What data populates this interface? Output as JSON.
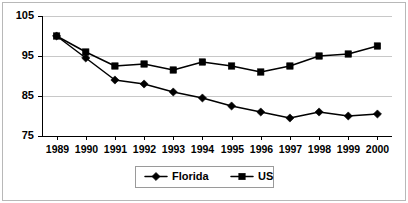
{
  "chart_data": {
    "type": "line",
    "title": "",
    "xlabel": "",
    "ylabel": "",
    "categories": [
      "1989",
      "1990",
      "1991",
      "1992",
      "1993",
      "1994",
      "1995",
      "1996",
      "1997",
      "1998",
      "1999",
      "2000"
    ],
    "series": [
      {
        "name": "Florida",
        "marker": "diamond",
        "color": "#000000",
        "values": [
          100,
          94.5,
          89,
          88,
          86,
          84.5,
          82.5,
          81,
          79.5,
          81,
          80,
          80.5
        ]
      },
      {
        "name": "US",
        "marker": "square",
        "color": "#000000",
        "values": [
          100,
          96,
          92.5,
          93,
          91.5,
          93.5,
          92.5,
          91,
          92.5,
          95,
          95.5,
          97.5
        ]
      }
    ],
    "ylim": [
      75,
      105
    ],
    "y_ticks": [
      75,
      85,
      95,
      105
    ],
    "y_tick_labels": [
      "75",
      "85",
      "95",
      "105"
    ],
    "grid": true,
    "grid_axis": "y",
    "legend_position": "bottom",
    "legend_entries": [
      "Florida",
      "US"
    ]
  },
  "axes": {
    "y_labels": [
      "105",
      "95",
      "85",
      "75"
    ],
    "x_labels": [
      "1989",
      "1990",
      "1991",
      "1992",
      "1993",
      "1994",
      "1995",
      "1996",
      "1997",
      "1998",
      "1999",
      "2000"
    ]
  },
  "legend": {
    "items": [
      {
        "label": "Florida",
        "marker": "diamond"
      },
      {
        "label": "US",
        "marker": "square"
      }
    ]
  },
  "colors": {
    "series": "#000000",
    "grid": "#c8c8c8",
    "axis": "#000000",
    "frame": "#b8b8b8",
    "background": "#ffffff"
  }
}
